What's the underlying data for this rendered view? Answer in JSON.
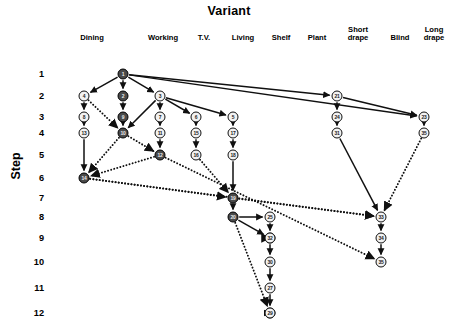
{
  "title": "Variant",
  "axes": {
    "y_title": "Step",
    "y_ticks": [
      "1",
      "2",
      "3",
      "4",
      "5",
      "6",
      "7",
      "8",
      "9",
      "10",
      "11",
      "12"
    ],
    "x_categories": [
      "Dining",
      "Working",
      "T.V.",
      "Living",
      "Shelf",
      "Plant",
      "Short\ndrape",
      "Blind",
      "Long\ndrape"
    ]
  },
  "legend_colors": {
    "dark_node_fill": "#4a4a4a",
    "light_node_fill": "#f2f2f2",
    "stroke": "#101010"
  },
  "chart_data": {
    "type": "diagram",
    "title": "Variant",
    "xlabel": "Variant",
    "ylabel": "Step",
    "ylim": [
      1,
      12
    ],
    "grid": false,
    "legend": "none",
    "categories": [
      "Dining",
      "Working",
      "T.V.",
      "Living",
      "Shelf",
      "Plant",
      "Short drape",
      "Blind",
      "Long drape"
    ],
    "tick_labels_y": [
      "1",
      "2",
      "3",
      "4",
      "5",
      "6",
      "7",
      "8",
      "9",
      "10",
      "11",
      "12"
    ],
    "nodes": [
      {
        "id": "1",
        "label": "1",
        "variant": "Working",
        "step": 1,
        "fill": "dark"
      },
      {
        "id": "4",
        "label": "4",
        "variant": "Dining",
        "step": 2,
        "fill": "light"
      },
      {
        "id": "2",
        "label": "2",
        "variant": "Working",
        "step": 2,
        "fill": "dark"
      },
      {
        "id": "3",
        "label": "3",
        "variant": "T.V.",
        "step": 2,
        "fill": "light"
      },
      {
        "id": "21",
        "label": "21",
        "variant": "Short drape",
        "step": 2,
        "fill": "light"
      },
      {
        "id": "8",
        "label": "8",
        "variant": "Dining",
        "step": 3,
        "fill": "light"
      },
      {
        "id": "9",
        "label": "9",
        "variant": "Working",
        "step": 3,
        "fill": "dark"
      },
      {
        "id": "7",
        "label": "7",
        "variant": "T.V.",
        "step": 3,
        "fill": "light"
      },
      {
        "id": "6",
        "label": "6",
        "variant": "Living",
        "step": 3,
        "fill": "light"
      },
      {
        "id": "5",
        "label": "5",
        "variant": "Shelf",
        "step": 3,
        "fill": "light"
      },
      {
        "id": "24",
        "label": "24",
        "variant": "Short drape",
        "step": 3,
        "fill": "light"
      },
      {
        "id": "23",
        "label": "23",
        "variant": "Long drape",
        "step": 3,
        "fill": "light"
      },
      {
        "id": "13",
        "label": "13",
        "variant": "Dining",
        "step": 4,
        "fill": "light"
      },
      {
        "id": "10",
        "label": "10",
        "variant": "Working",
        "step": 4,
        "fill": "dark"
      },
      {
        "id": "11",
        "label": "11",
        "variant": "T.V.",
        "step": 4,
        "fill": "light"
      },
      {
        "id": "15",
        "label": "15",
        "variant": "Living",
        "step": 4,
        "fill": "light"
      },
      {
        "id": "17",
        "label": "17",
        "variant": "Shelf",
        "step": 4,
        "fill": "light"
      },
      {
        "id": "31",
        "label": "31",
        "variant": "Short drape",
        "step": 4,
        "fill": "light"
      },
      {
        "id": "35b",
        "label": "35",
        "variant": "Long drape",
        "step": 4,
        "fill": "light"
      },
      {
        "id": "12",
        "label": "12",
        "variant": "T.V.",
        "step": 5,
        "fill": "dark"
      },
      {
        "id": "16",
        "label": "16",
        "variant": "Living",
        "step": 5,
        "fill": "light"
      },
      {
        "id": "18",
        "label": "18",
        "variant": "Shelf",
        "step": 5,
        "fill": "light"
      },
      {
        "id": "14",
        "label": "14",
        "variant": "Dining",
        "step": 6,
        "fill": "dark"
      },
      {
        "id": "19",
        "label": "19",
        "variant": "Shelf",
        "step": 7,
        "fill": "dark"
      },
      {
        "id": "20",
        "label": "20",
        "variant": "Shelf",
        "step": 8,
        "fill": "dark"
      },
      {
        "id": "25",
        "label": "25",
        "variant": "Plant",
        "step": 8,
        "fill": "light"
      },
      {
        "id": "33",
        "label": "33",
        "variant": "Blind",
        "step": 8,
        "fill": "light"
      },
      {
        "id": "26",
        "label": "26",
        "variant": "Plant",
        "step": 9,
        "fill": "light"
      },
      {
        "id": "32",
        "label": "32",
        "variant": "Plant",
        "step": 9,
        "fill": "light"
      },
      {
        "id": "34",
        "label": "34",
        "variant": "Blind",
        "step": 9,
        "fill": "light"
      },
      {
        "id": "30",
        "label": "30",
        "variant": "Plant",
        "step": 10,
        "fill": "light"
      },
      {
        "id": "35",
        "label": "35",
        "variant": "Blind",
        "step": 10,
        "fill": "light"
      },
      {
        "id": "27",
        "label": "27",
        "variant": "Plant",
        "step": 11,
        "fill": "light"
      },
      {
        "id": "28",
        "label": "28",
        "variant": "Plant",
        "step": 12,
        "fill": "light"
      },
      {
        "id": "29",
        "label": "29",
        "variant": "Plant",
        "step": 12,
        "fill": "light"
      }
    ],
    "edges": [
      {
        "from": "1",
        "to": "4",
        "style": "solid"
      },
      {
        "from": "1",
        "to": "2",
        "style": "solid"
      },
      {
        "from": "1",
        "to": "3",
        "style": "solid"
      },
      {
        "from": "1",
        "to": "21",
        "style": "solid"
      },
      {
        "from": "1",
        "to": "23",
        "style": "solid"
      },
      {
        "from": "4",
        "to": "8",
        "style": "solid"
      },
      {
        "from": "4",
        "to": "10",
        "style": "dotted"
      },
      {
        "from": "2",
        "to": "9",
        "style": "solid"
      },
      {
        "from": "9",
        "to": "10",
        "style": "solid"
      },
      {
        "from": "3",
        "to": "7",
        "style": "solid"
      },
      {
        "from": "3",
        "to": "6",
        "style": "solid"
      },
      {
        "from": "3",
        "to": "5",
        "style": "solid"
      },
      {
        "from": "3",
        "to": "10",
        "style": "solid"
      },
      {
        "from": "8",
        "to": "13",
        "style": "solid"
      },
      {
        "from": "13",
        "to": "14",
        "style": "solid"
      },
      {
        "from": "7",
        "to": "11",
        "style": "solid"
      },
      {
        "from": "11",
        "to": "12",
        "style": "solid"
      },
      {
        "from": "6",
        "to": "15",
        "style": "solid"
      },
      {
        "from": "15",
        "to": "16",
        "style": "solid"
      },
      {
        "from": "5",
        "to": "17",
        "style": "solid"
      },
      {
        "from": "17",
        "to": "18",
        "style": "solid"
      },
      {
        "from": "18",
        "to": "19",
        "style": "solid"
      },
      {
        "from": "10",
        "to": "12",
        "style": "dotted"
      },
      {
        "from": "10",
        "to": "14",
        "style": "dotted"
      },
      {
        "from": "12",
        "to": "14",
        "style": "dotted"
      },
      {
        "from": "16",
        "to": "19",
        "style": "dotted"
      },
      {
        "from": "14",
        "to": "19",
        "style": "dotted"
      },
      {
        "from": "14",
        "to": "33",
        "style": "dotted"
      },
      {
        "from": "19",
        "to": "20",
        "style": "solid"
      },
      {
        "from": "19",
        "to": "33",
        "style": "dotted"
      },
      {
        "from": "20",
        "to": "25",
        "style": "solid"
      },
      {
        "from": "20",
        "to": "26",
        "style": "solid"
      },
      {
        "from": "20",
        "to": "28",
        "style": "dotted"
      },
      {
        "from": "25",
        "to": "32",
        "style": "solid"
      },
      {
        "from": "26",
        "to": "30",
        "style": "solid"
      },
      {
        "from": "30",
        "to": "27",
        "style": "solid"
      },
      {
        "from": "27",
        "to": "28",
        "style": "solid"
      },
      {
        "from": "28",
        "to": "29",
        "style": "solid"
      },
      {
        "from": "21",
        "to": "24",
        "style": "solid"
      },
      {
        "from": "21",
        "to": "23",
        "style": "solid"
      },
      {
        "from": "24",
        "to": "31",
        "style": "solid"
      },
      {
        "from": "31",
        "to": "33",
        "style": "solid"
      },
      {
        "from": "23",
        "to": "35b",
        "style": "solid"
      },
      {
        "from": "35b",
        "to": "33",
        "style": "dotted"
      },
      {
        "from": "33",
        "to": "34",
        "style": "solid"
      },
      {
        "from": "34",
        "to": "35",
        "style": "solid"
      },
      {
        "from": "12",
        "to": "35",
        "style": "dotted"
      },
      {
        "from": "32",
        "to": "26",
        "style": "dotted"
      }
    ]
  }
}
